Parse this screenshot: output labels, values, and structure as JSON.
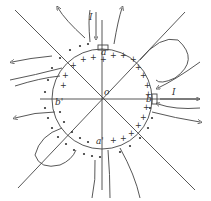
{
  "diagram": {
    "labels": {
      "center": "o",
      "a": "a",
      "b": "b",
      "a_prime": "a'",
      "b_prime": "b'",
      "current_top": "I",
      "current_right": "I"
    },
    "symbols": {
      "positive": "+",
      "negative": "•"
    },
    "colors": {
      "stroke": "#444444",
      "background": "#ffffff"
    }
  }
}
